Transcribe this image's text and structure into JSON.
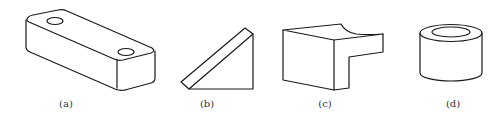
{
  "figure": {
    "panels": [
      {
        "id": "a",
        "label": "(a)",
        "object": "rectangular-block-with-two-holes"
      },
      {
        "id": "b",
        "label": "(b)",
        "object": "chamfered-triangular-prism"
      },
      {
        "id": "c",
        "label": "(c)",
        "object": "l-shaped-block-with-curved-cut"
      },
      {
        "id": "d",
        "label": "(d)",
        "object": "hollow-cylinder-bushing"
      }
    ],
    "colors": {
      "line": "#1a1a1a",
      "label": "#333333",
      "background": "#ffffff"
    }
  }
}
